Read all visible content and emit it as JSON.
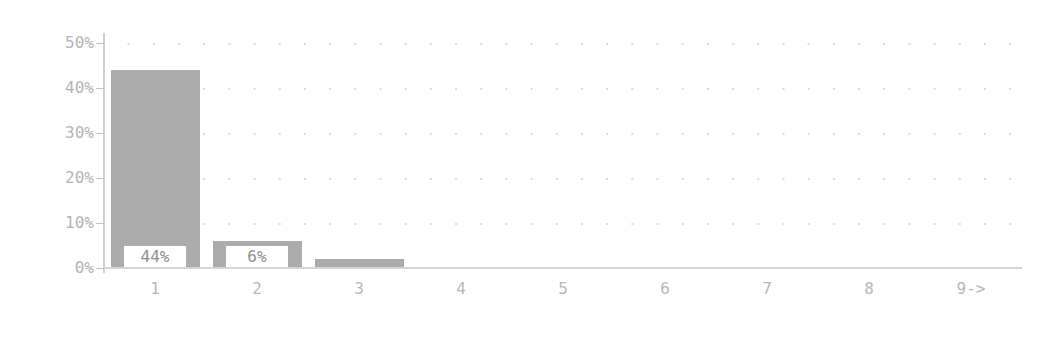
{
  "chart_data": {
    "type": "bar",
    "title": "",
    "subtitle": "",
    "xlabel": "",
    "ylabel": "",
    "categories": [
      "1",
      "2",
      "3",
      "4",
      "5",
      "6",
      "7",
      "8",
      "9->"
    ],
    "values": [
      44,
      6,
      2,
      0,
      0,
      0,
      0,
      0,
      0
    ],
    "value_labels": [
      "44%",
      "6%",
      "",
      "",
      "",
      "",
      "",
      "",
      ""
    ],
    "ylim": [
      0,
      50
    ],
    "ytick_labels": [
      "50%",
      "40%",
      "30%",
      "20%",
      "10%",
      "0%"
    ],
    "ytick_values": [
      50,
      40,
      30,
      20,
      10,
      0
    ],
    "grid": "dotted-horizontal",
    "grid_rows": [
      50,
      40,
      30,
      20,
      10
    ],
    "legend": "none",
    "unit": "percent",
    "bar_color": "#ababab",
    "axis_color": "#d0d0d0",
    "label_color": "#b4b4b4",
    "value_label_color": "#8f8f8f",
    "background_color": "#ffffff"
  },
  "axis": {
    "y_ticks": [
      {
        "label": "50%",
        "value": 50
      },
      {
        "label": "40%",
        "value": 40
      },
      {
        "label": "30%",
        "value": 30
      },
      {
        "label": "20%",
        "value": 20
      },
      {
        "label": "10%",
        "value": 10
      },
      {
        "label": "0%",
        "value": 0
      }
    ],
    "x_ticks": [
      {
        "label": "1"
      },
      {
        "label": "2"
      },
      {
        "label": "3"
      },
      {
        "label": "4"
      },
      {
        "label": "5"
      },
      {
        "label": "6"
      },
      {
        "label": "7"
      },
      {
        "label": "8"
      },
      {
        "label": "9->"
      }
    ]
  },
  "bars": [
    {
      "category": "1",
      "value": 44,
      "label": "44%"
    },
    {
      "category": "2",
      "value": 6,
      "label": "6%"
    },
    {
      "category": "3",
      "value": 2,
      "label": ""
    },
    {
      "category": "4",
      "value": 0,
      "label": ""
    },
    {
      "category": "5",
      "value": 0,
      "label": ""
    },
    {
      "category": "6",
      "value": 0,
      "label": ""
    },
    {
      "category": "7",
      "value": 0,
      "label": ""
    },
    {
      "category": "8",
      "value": 0,
      "label": ""
    },
    {
      "category": "9->",
      "value": 0,
      "label": ""
    }
  ]
}
